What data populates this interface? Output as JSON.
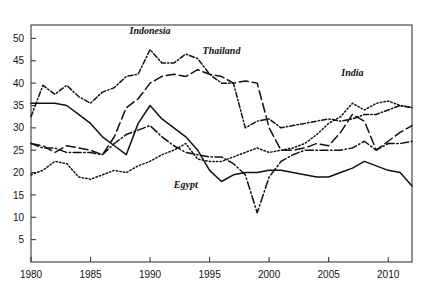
{
  "chart_data": {
    "type": "line",
    "title": "",
    "ylabel": "Percent GDP",
    "xlabel": "",
    "ylim": [
      0,
      53
    ],
    "xlim": [
      1980,
      2012
    ],
    "yticks": [
      5,
      10,
      15,
      20,
      25,
      30,
      35,
      40,
      45,
      50
    ],
    "xticks": [
      1980,
      1985,
      1990,
      1995,
      2000,
      2005,
      2010
    ],
    "grid": false,
    "legend": "inline-annotations",
    "x": [
      1980,
      1981,
      1982,
      1983,
      1984,
      1985,
      1986,
      1987,
      1988,
      1989,
      1990,
      1991,
      1992,
      1993,
      1994,
      1995,
      1996,
      1997,
      1998,
      1999,
      2000,
      2001,
      2002,
      2003,
      2004,
      2005,
      2006,
      2007,
      2008,
      2009,
      2010,
      2011,
      2012
    ],
    "series": [
      {
        "name": "Indonesia",
        "style": "dash-dot-short",
        "label": "Indonesia",
        "label_x": 1990,
        "label_y": 51,
        "values": [
          32.5,
          39.5,
          37.5,
          39.5,
          37.0,
          35.5,
          38.0,
          39.0,
          41.5,
          42.0,
          47.5,
          44.5,
          44.5,
          46.5,
          45.5,
          42.0,
          40.0,
          40.0,
          30.0,
          31.5,
          32.0,
          30.0,
          30.5,
          31.0,
          31.5,
          32.0,
          31.5,
          32.0,
          33.0,
          33.0,
          34.0,
          35.0,
          34.5
        ]
      },
      {
        "name": "Thailand",
        "style": "long-dash",
        "label": "Thailand",
        "label_x": 1996,
        "label_y": 46.5,
        "values": [
          26.5,
          26.0,
          24.5,
          26.0,
          25.5,
          25.0,
          24.0,
          28.0,
          34.5,
          36.5,
          40.0,
          41.5,
          42.0,
          41.5,
          43.0,
          42.0,
          41.5,
          40.0,
          40.5,
          40.0,
          30.0,
          25.0,
          25.0,
          25.5,
          26.5,
          26.0,
          29.0,
          33.0,
          31.5,
          25.0,
          27.0,
          29.0,
          30.5
        ]
      },
      {
        "name": "India",
        "style": "fine-dot",
        "label": "India",
        "label_x": 2007,
        "label_y": 41.5,
        "values": [
          19.5,
          20.5,
          22.5,
          22.0,
          19.0,
          18.5,
          19.5,
          20.5,
          20.0,
          21.5,
          22.5,
          24.0,
          25.0,
          26.5,
          23.0,
          22.5,
          22.5,
          23.5,
          24.5,
          25.5,
          24.5,
          25.0,
          25.5,
          26.5,
          28.5,
          31.0,
          32.5,
          35.5,
          34.0,
          35.5,
          36.0,
          35.0,
          34.5
        ]
      },
      {
        "name": "Egypt",
        "style": "solid",
        "label": "Egypt",
        "label_x": 1993,
        "label_y": 16.5,
        "values": [
          35.5,
          35.5,
          35.5,
          35.0,
          33.0,
          31.0,
          28.0,
          26.0,
          24.0,
          31.0,
          35.0,
          32.0,
          30.0,
          28.0,
          25.0,
          20.5,
          18.0,
          19.5,
          20.0,
          20.0,
          20.5,
          20.5,
          20.0,
          19.5,
          19.0,
          19.0,
          20.0,
          21.0,
          22.5,
          21.5,
          20.5,
          20.0,
          17.0
        ]
      },
      {
        "name": "unlabeled-fifth",
        "style": "dash-dot-long",
        "label": "",
        "label_x": null,
        "label_y": null,
        "values": [
          26.5,
          25.5,
          25.5,
          24.5,
          24.5,
          24.5,
          24.0,
          26.5,
          28.5,
          29.5,
          30.5,
          28.0,
          26.0,
          24.5,
          24.0,
          23.5,
          23.5,
          22.0,
          19.5,
          11.0,
          19.0,
          22.5,
          24.0,
          25.0,
          25.0,
          25.0,
          25.0,
          25.5,
          27.0,
          25.0,
          26.5,
          26.5,
          27.0
        ]
      }
    ]
  },
  "axis_labels": {
    "y": [
      "50",
      "45",
      "40",
      "35",
      "30",
      "25",
      "20",
      "15",
      "10",
      "5"
    ],
    "x": [
      "1980",
      "1985",
      "1990",
      "1995",
      "2000",
      "2005",
      "2010"
    ]
  }
}
